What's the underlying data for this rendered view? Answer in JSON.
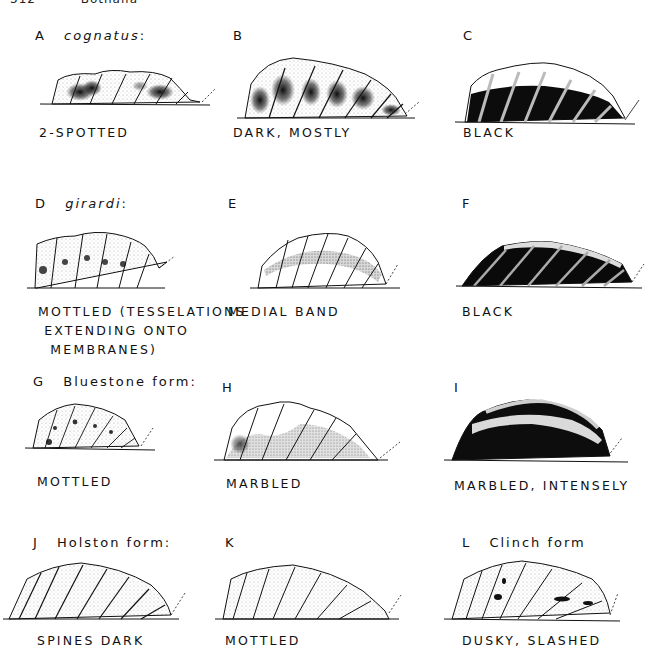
{
  "running_head": {
    "page": "312",
    "title": "Bothalia"
  },
  "figure": {
    "panels": [
      {
        "letter": "A",
        "taxon": "cognatus",
        "taxon_suffix": ":",
        "caption": [
          "2-SPOTTED"
        ],
        "pattern": "two-spotted"
      },
      {
        "letter": "B",
        "taxon": "",
        "taxon_suffix": "",
        "caption": [
          "DARK, MOSTLY"
        ],
        "pattern": "dark"
      },
      {
        "letter": "C",
        "taxon": "",
        "taxon_suffix": "",
        "caption": [
          "BLACK"
        ],
        "pattern": "black"
      },
      {
        "letter": "D",
        "taxon": "girardi",
        "taxon_suffix": ":",
        "caption": [
          "MOTTLED (TESSELATIONS",
          " EXTENDING ONTO",
          "  MEMBRANES)"
        ],
        "pattern": "mottled-light"
      },
      {
        "letter": "E",
        "taxon": "",
        "taxon_suffix": "",
        "caption": [
          "MEDIAL BAND"
        ],
        "pattern": "medial-band"
      },
      {
        "letter": "F",
        "taxon": "",
        "taxon_suffix": "",
        "caption": [
          "BLACK"
        ],
        "pattern": "black-full"
      },
      {
        "letter": "G",
        "form": "Bluestone form:",
        "caption": [
          "MOTTLED"
        ],
        "pattern": "mottled"
      },
      {
        "letter": "H",
        "form": "",
        "caption": [
          "MARBLED"
        ],
        "pattern": "marbled"
      },
      {
        "letter": "I",
        "form": "",
        "caption": [
          "MARBLED, INTENSELY"
        ],
        "pattern": "marbled-intense"
      },
      {
        "letter": "J",
        "form": "Holston form:",
        "caption": [
          "SPINES DARK"
        ],
        "pattern": "spines-dark"
      },
      {
        "letter": "K",
        "form": "",
        "caption": [
          "MOTTLED"
        ],
        "pattern": "mottled-sparse"
      },
      {
        "letter": "L",
        "form": "Clinch form",
        "caption": [
          "DUSKY, SLASHED"
        ],
        "pattern": "dusky-slashed"
      }
    ]
  },
  "colors": {
    "ink": "#111111",
    "paper": "#ffffff",
    "stipple": "#8a8a8a"
  }
}
